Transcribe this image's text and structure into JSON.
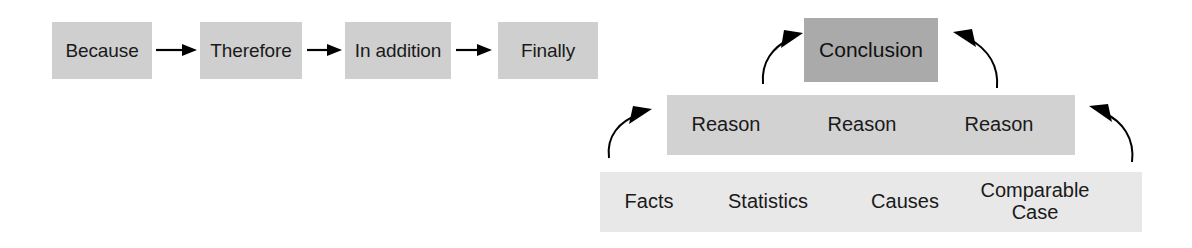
{
  "diagram": {
    "colors": {
      "background": "#ffffff",
      "chain_box_fill": "#cfcfcf",
      "conclusion_fill": "#aaaaaa",
      "reason_fill": "#d2d2d2",
      "evidence_fill": "#e8e8e8",
      "text": "#1a1a1a",
      "arrow": "#000000"
    },
    "chain": {
      "name": "sequence-chain",
      "items": [
        {
          "label": "Because",
          "x": 52,
          "y": 22,
          "w": 100,
          "h": 57
        },
        {
          "label": "Therefore",
          "x": 200,
          "y": 22,
          "w": 102,
          "h": 57
        },
        {
          "label": "In addition",
          "x": 345,
          "y": 22,
          "w": 106,
          "h": 57
        },
        {
          "label": "Finally",
          "x": 498,
          "y": 22,
          "w": 100,
          "h": 57
        }
      ],
      "connectors": [
        {
          "name": "chain-arrow-1",
          "x": 156,
          "y": 50,
          "len": 40
        },
        {
          "name": "chain-arrow-2",
          "x": 306,
          "y": 50,
          "len": 35
        },
        {
          "name": "chain-arrow-3",
          "x": 456,
          "y": 50,
          "len": 38
        }
      ]
    },
    "pyramid": {
      "name": "argument-pyramid",
      "conclusion": {
        "label": "Conclusion",
        "x": 804,
        "y": 18,
        "w": 134,
        "h": 64
      },
      "reasons": {
        "bar": {
          "x": 667,
          "y": 95,
          "w": 408,
          "h": 60
        },
        "labels": [
          "Reason",
          "Reason",
          "Reason"
        ],
        "label_x": [
          700,
          838,
          975
        ]
      },
      "evidence": {
        "bar": {
          "x": 600,
          "y": 172,
          "w": 542,
          "h": 60
        },
        "labels": [
          "Facts",
          "Statistics",
          "Causes",
          "Comparable\nCase"
        ],
        "label_x": [
          648,
          768,
          905,
          1035
        ]
      },
      "curved_arrows": [
        {
          "name": "arrow-reason-to-conclusion-left",
          "path": "M 763,82 C 763,58 778,43 797,35",
          "head": "left-up"
        },
        {
          "name": "arrow-reason-to-conclusion-right",
          "path": "M 996,86 C 996,60 980,44 960,34",
          "head": "right-up"
        },
        {
          "name": "arrow-evidence-to-reason-left",
          "path": "M 609,156 C 609,132 624,118 645,112",
          "head": "left-up"
        },
        {
          "name": "arrow-evidence-to-reason-right",
          "path": "M 1132,160 C 1132,134 1115,118 1096,110",
          "head": "right-up"
        }
      ]
    }
  }
}
